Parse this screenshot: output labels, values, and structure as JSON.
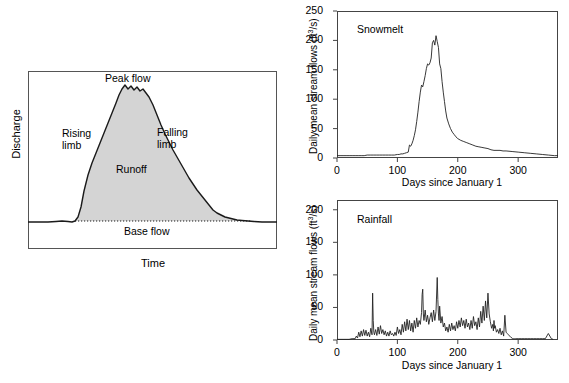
{
  "figure": {
    "panels": [
      "hydrograph-diagram",
      "snowmelt-chart",
      "rainfall-chart"
    ]
  },
  "hydrograph": {
    "ylabel": "Discharge",
    "xlabel": "Time",
    "annotations": {
      "peak_flow": "Peak flow",
      "rising_limb": "Rising\nlimb",
      "rising_limb_line1": "Rising",
      "rising_limb_line2": "limb",
      "falling_limb_line1": "Falling",
      "falling_limb_line2": "limb",
      "runoff": "Runoff",
      "base_flow": "Base flow"
    },
    "fill_color": "#d4d4d4",
    "line_color": "#1a1a1a",
    "frame_color": "#555555"
  },
  "chart_data": [
    {
      "id": "snowmelt",
      "type": "line",
      "title": "Snowmelt",
      "xlabel": "Days since January 1",
      "ylabel": "Daily mean stream flows (ft3/s)",
      "ylabel_units": "ft3/s",
      "xlim": [
        0,
        366
      ],
      "ylim": [
        0,
        250
      ],
      "yticks": [
        0,
        50,
        100,
        150,
        200,
        250
      ],
      "xticks": [
        0,
        100,
        200,
        300
      ],
      "grid": false,
      "legend": "none",
      "line_color": "#222222",
      "x": [
        0,
        5,
        10,
        15,
        20,
        25,
        30,
        35,
        40,
        45,
        50,
        55,
        60,
        65,
        70,
        75,
        80,
        85,
        90,
        95,
        100,
        103,
        106,
        109,
        112,
        115,
        118,
        120,
        122,
        124,
        126,
        128,
        130,
        132,
        134,
        136,
        138,
        140,
        142,
        144,
        146,
        148,
        150,
        152,
        154,
        156,
        158,
        160,
        162,
        164,
        166,
        168,
        170,
        172,
        174,
        176,
        178,
        180,
        182,
        185,
        188,
        191,
        194,
        197,
        200,
        205,
        210,
        215,
        220,
        225,
        230,
        235,
        240,
        245,
        250,
        255,
        260,
        265,
        270,
        275,
        280,
        290,
        300,
        310,
        320,
        330,
        340,
        350,
        360,
        366
      ],
      "y": [
        4,
        4,
        4,
        4,
        4,
        4,
        4,
        4,
        4,
        4,
        5,
        5,
        5,
        5,
        5,
        5,
        5,
        5,
        5,
        5,
        6,
        6,
        7,
        7,
        8,
        9,
        10,
        22,
        20,
        24,
        30,
        38,
        48,
        62,
        78,
        96,
        112,
        124,
        121,
        130,
        140,
        152,
        160,
        158,
        162,
        170,
        196,
        200,
        192,
        208,
        198,
        188,
        160,
        152,
        130,
        112,
        96,
        80,
        68,
        58,
        50,
        44,
        40,
        36,
        33,
        30,
        28,
        26,
        24,
        22,
        20,
        19,
        18,
        17,
        16,
        14,
        13,
        13,
        13,
        12,
        12,
        11,
        10,
        9,
        8,
        7,
        6,
        5,
        4,
        4
      ]
    },
    {
      "id": "rainfall",
      "type": "line",
      "title": "Rainfall",
      "xlabel": "Days since January 1",
      "ylabel": "Daily mean stream flows (ft3/s)",
      "ylabel_units": "ft3/s",
      "xlim": [
        0,
        366
      ],
      "ylim": [
        0,
        215
      ],
      "yticks": [
        0,
        50,
        100,
        150,
        200
      ],
      "xticks": [
        0,
        100,
        200,
        300
      ],
      "grid": false,
      "legend": "none",
      "line_color": "#222222",
      "x": [
        0,
        5,
        10,
        15,
        20,
        25,
        30,
        32,
        34,
        36,
        38,
        40,
        42,
        44,
        46,
        48,
        50,
        52,
        54,
        56,
        58,
        59,
        60,
        61,
        62,
        64,
        66,
        68,
        70,
        72,
        74,
        76,
        78,
        80,
        82,
        84,
        86,
        88,
        90,
        92,
        94,
        96,
        98,
        100,
        102,
        104,
        106,
        108,
        110,
        112,
        114,
        116,
        118,
        120,
        122,
        124,
        126,
        128,
        130,
        132,
        134,
        136,
        138,
        140,
        141,
        142,
        143,
        144,
        146,
        148,
        150,
        152,
        154,
        156,
        158,
        160,
        162,
        164,
        166,
        167,
        168,
        169,
        170,
        172,
        174,
        176,
        178,
        180,
        182,
        184,
        186,
        188,
        190,
        192,
        194,
        196,
        198,
        200,
        202,
        204,
        206,
        208,
        210,
        212,
        214,
        216,
        218,
        220,
        222,
        224,
        226,
        228,
        230,
        232,
        234,
        236,
        238,
        240,
        242,
        244,
        246,
        248,
        250,
        252,
        254,
        256,
        258,
        259,
        260,
        261,
        262,
        264,
        266,
        268,
        270,
        272,
        274,
        276,
        278,
        280,
        282,
        284,
        286,
        288,
        290,
        291,
        292,
        294,
        296,
        298,
        300,
        305,
        310,
        315,
        320,
        325,
        330,
        335,
        340,
        345,
        350,
        355,
        358,
        360,
        361,
        362,
        363,
        364,
        366
      ],
      "y": [
        1,
        1,
        1,
        1,
        1,
        2,
        2,
        6,
        3,
        12,
        5,
        14,
        6,
        16,
        7,
        15,
        6,
        12,
        5,
        18,
        8,
        72,
        30,
        12,
        8,
        16,
        7,
        20,
        9,
        22,
        10,
        16,
        8,
        14,
        6,
        12,
        6,
        14,
        8,
        10,
        6,
        12,
        7,
        20,
        10,
        16,
        8,
        24,
        12,
        28,
        14,
        32,
        16,
        30,
        14,
        26,
        12,
        30,
        18,
        34,
        20,
        30,
        24,
        42,
        70,
        78,
        40,
        30,
        46,
        28,
        38,
        24,
        34,
        42,
        28,
        46,
        30,
        44,
        96,
        62,
        40,
        30,
        52,
        26,
        36,
        20,
        26,
        14,
        20,
        12,
        24,
        14,
        26,
        16,
        22,
        14,
        28,
        18,
        30,
        20,
        34,
        22,
        30,
        18,
        32,
        20,
        26,
        16,
        30,
        18,
        36,
        22,
        28,
        16,
        34,
        20,
        44,
        26,
        52,
        30,
        60,
        34,
        72,
        40,
        28,
        18,
        24,
        14,
        30,
        18,
        22,
        12,
        16,
        10,
        18,
        8,
        14,
        6,
        38,
        12,
        10,
        8,
        6,
        4,
        3,
        2,
        2,
        2,
        2,
        2,
        2,
        2,
        2,
        2,
        2,
        2,
        2,
        2,
        2,
        2,
        10,
        2,
        1
      ]
    }
  ]
}
